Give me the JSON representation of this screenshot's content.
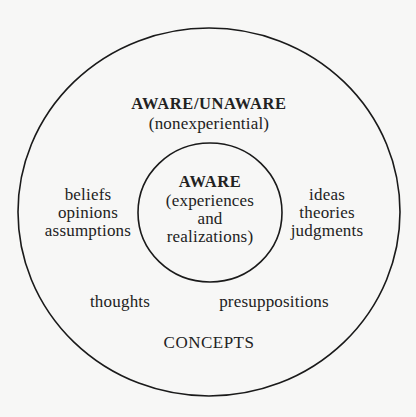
{
  "diagram": {
    "outer_region": {
      "title": "AWARE/UNAWARE",
      "subtitle": "(nonexperiential)",
      "left_group": [
        "beliefs",
        "opinions",
        "assumptions"
      ],
      "right_group": [
        "ideas",
        "theories",
        "judgments"
      ],
      "bottom_left": "thoughts",
      "bottom_right": "presuppositions",
      "footer": "CONCEPTS"
    },
    "inner_region": {
      "title": "AWARE",
      "lines": [
        "(experiences",
        "and",
        "realizations)"
      ]
    },
    "colors": {
      "stroke": "#1a1a1a",
      "text": "#222222",
      "background": "#f7f7f6"
    }
  }
}
